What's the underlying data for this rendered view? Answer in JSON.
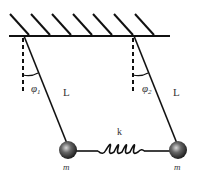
{
  "diagram": {
    "labels": {
      "angle_left": "φ",
      "angle_left_sub": "1",
      "angle_right": "φ",
      "angle_right_sub": "2",
      "length_left": "L",
      "length_right": "L",
      "spring": "k",
      "mass_left": "m",
      "mass_right": "m"
    },
    "colors": {
      "line": "#111111",
      "mass": "#444444",
      "text": "#333333"
    }
  }
}
